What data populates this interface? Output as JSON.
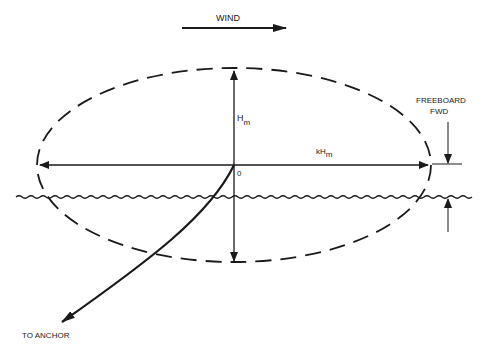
{
  "diagram": {
    "labels": {
      "wind": "WIND",
      "height": "H",
      "height_sub": "m",
      "horizontal_prefix": "kH",
      "horizontal_sub": "m",
      "origin": "0",
      "freeboard_line1": "FREEBOARD",
      "freeboard_line2": "FWD",
      "anchor": "TO ANCHOR"
    },
    "colors": {
      "ink": "#1a1a1a",
      "background": "#ffffff"
    }
  }
}
